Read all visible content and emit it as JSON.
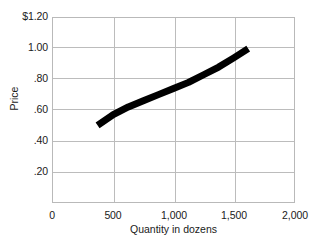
{
  "chart_data": {
    "type": "line",
    "title": "",
    "xlabel": "Quantity in dozens",
    "ylabel": "Price",
    "xlim": [
      0,
      2000
    ],
    "ylim": [
      0,
      1.2
    ],
    "grid": true,
    "legend": null,
    "x_ticks": [
      {
        "value": 0,
        "label": "0"
      },
      {
        "value": 500,
        "label": "500"
      },
      {
        "value": 1000,
        "label": "1,000"
      },
      {
        "value": 1500,
        "label": "1,500"
      },
      {
        "value": 2000,
        "label": "2,000"
      }
    ],
    "y_ticks": [
      {
        "value": 1.2,
        "label": "$1.20"
      },
      {
        "value": 1.0,
        "label": "1.00"
      },
      {
        "value": 0.8,
        "label": ".80"
      },
      {
        "value": 0.6,
        "label": ".60"
      },
      {
        "value": 0.4,
        "label": ".40"
      },
      {
        "value": 0.2,
        "label": ".20"
      }
    ],
    "series": [
      {
        "name": "supply-curve",
        "color": "#000000",
        "line_width": 7,
        "x": [
          370,
          500,
          625,
          750,
          875,
          1000,
          1125,
          1250,
          1375,
          1500,
          1620
        ],
        "y": [
          0.5,
          0.57,
          0.62,
          0.66,
          0.7,
          0.74,
          0.78,
          0.83,
          0.88,
          0.94,
          1.0
        ]
      }
    ],
    "annotations": []
  },
  "style": {
    "grid_color": "#bcbcbc",
    "axis_color": "#b9b9b9",
    "text_color": "#1a1a1a",
    "background": "#ffffff",
    "curve_color": "#000000"
  }
}
